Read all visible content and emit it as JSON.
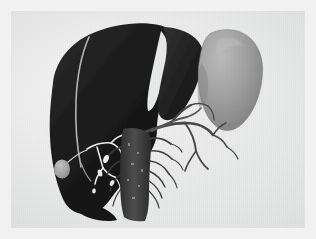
{
  "viewer": {
    "title": "3D Abdominal Volume Rendering",
    "background_color": "#f1f1f1",
    "canvas_color": "#eceded",
    "canvas": {
      "x": 11,
      "y": 11,
      "width": 294,
      "height": 217
    }
  },
  "render": {
    "modality": "volume-rendered surface model",
    "view": "anterior oblique",
    "structures": [
      {
        "name": "liver",
        "label": "Liver",
        "color": "#1f1f1f",
        "highlight_color": "#3a3a3a",
        "shade_color": "#121212",
        "description": "Large dark silhouetted liver occupying left and central field, right and left lobes separated by a bright notch"
      },
      {
        "name": "liver-left-lobe",
        "label": "Left hepatic lobe",
        "color": "#272727",
        "description": "Lobe to the right of the bright falciform notch"
      },
      {
        "name": "hepatic-surface-vessel",
        "label": "Surface hepatic vein",
        "color": "#b9b9b9",
        "description": "Thin pale curvilinear vessel descending across the liver dome"
      },
      {
        "name": "falciform-notch",
        "label": "Falciform notch",
        "color": "#e9e9e9",
        "description": "Bright vertical wedge dividing the hepatic lobes"
      },
      {
        "name": "kidney",
        "label": "Right kidney",
        "color": "#9b9b9b",
        "highlight_color": "#b4b4b4",
        "shade_color": "#7e7e7e",
        "description": "Mid-gray bean-shaped organ at upper right"
      },
      {
        "name": "gallbladder",
        "label": "Gallbladder",
        "color": "#a9a9a9",
        "description": "Small rounded light blob at the inferior liver margin"
      },
      {
        "name": "biliary-tree",
        "label": "Biliary tree",
        "color": "#f0f0f0",
        "description": "Bright thin branching ducts below the hepatic hilum"
      },
      {
        "name": "portal-vessels",
        "label": "Portal and mesenteric vessels",
        "color": "#4a4a4a",
        "description": "Dark branching vascular tree extending to the right of the hilum"
      },
      {
        "name": "aorta-trunk",
        "label": "Aorta / vena cava trunk",
        "color": "#3d3d3d",
        "description": "Vertical dark trunk descending in the midline with spiky branch stubs"
      },
      {
        "name": "renal-vessels",
        "label": "Renal vessels",
        "color": "#565656",
        "description": "Short vessel stubs bridging trunk to kidney"
      }
    ]
  }
}
